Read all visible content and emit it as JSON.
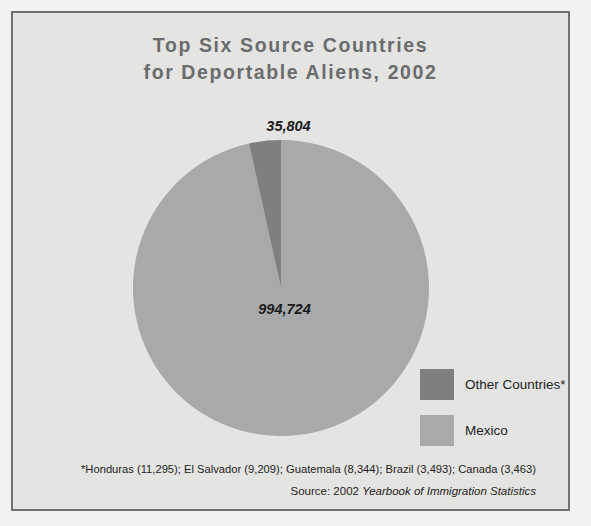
{
  "figure": {
    "title": "Top Six Source Countries\nfor Deportable Aliens, 2002",
    "background_color": "#e4e4e2",
    "frame_color": "#6f7072",
    "title_color": "#6b6c6e"
  },
  "labels": {
    "other_value": "35,804",
    "mexico_value": "994,724"
  },
  "legend": {
    "items": [
      {
        "label": "Other Countries*",
        "color": "#7e7f81"
      },
      {
        "label": "Mexico",
        "color": "#a8a9ab"
      }
    ]
  },
  "footnote": {
    "text": "*Honduras (11,295); El Salvador (9,209); Guatemala (8,344); Brazil (3,493); Canada (3,463)"
  },
  "source": {
    "prefix": "Source: 2002 ",
    "publication": "Yearbook of Immigration Statistics"
  },
  "chart_data": {
    "type": "pie",
    "title": "Top Six Source Countries for Deportable Aliens, 2002",
    "categories": [
      "Other Countries*",
      "Mexico"
    ],
    "values": [
      35804,
      994724
    ],
    "value_labels": [
      "35,804",
      "994,724"
    ],
    "percentages": [
      3.47,
      96.53
    ],
    "colors": [
      "#7e7f81",
      "#a8a9ab"
    ],
    "total": 1030528,
    "start_angle_deg": 90,
    "direction": "counterclockwise",
    "legend_position": "right",
    "grid": false,
    "footnote_breakdown": [
      {
        "country": "Honduras",
        "value": 11295,
        "value_label": "11,295"
      },
      {
        "country": "El Salvador",
        "value": 9209,
        "value_label": "9,209"
      },
      {
        "country": "Guatemala",
        "value": 8344,
        "value_label": "8,344"
      },
      {
        "country": "Brazil",
        "value": 3493,
        "value_label": "3,493"
      },
      {
        "country": "Canada",
        "value": 3463,
        "value_label": "3,463"
      }
    ],
    "source": "Source: 2002 Yearbook of Immigration Statistics"
  }
}
